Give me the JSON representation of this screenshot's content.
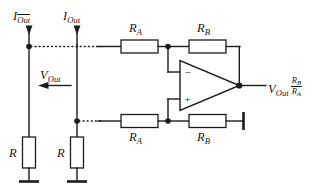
{
  "figure": {
    "type": "circuit-schematic",
    "background_color": "#ffffff",
    "line_color": "#1c1c1c"
  },
  "labels": {
    "current_out_bar": {
      "symbol": "I",
      "subscript": "Out",
      "overline": true
    },
    "current_out": {
      "symbol": "I",
      "subscript": "Out",
      "overline": false
    },
    "voltage_out": {
      "symbol": "V",
      "subscript": "Out"
    },
    "output_expression": {
      "symbol": "V",
      "subscript": "Out",
      "fraction_numerator": "R",
      "fraction_numerator_sub": "B",
      "fraction_denominator": "R",
      "fraction_denominator_sub": "A"
    },
    "resistor_r_left": {
      "symbol": "R"
    },
    "resistor_r_right": {
      "symbol": "R"
    },
    "resistor_ra_top": {
      "symbol": "R",
      "subscript": "A"
    },
    "resistor_rb_top": {
      "symbol": "R",
      "subscript": "B"
    },
    "resistor_ra_bottom": {
      "symbol": "R",
      "subscript": "A"
    },
    "resistor_rb_bottom": {
      "symbol": "R",
      "subscript": "B"
    }
  },
  "opamp": {
    "inverting_input_symbol": "−",
    "noninverting_input_symbol": "+"
  },
  "components": [
    {
      "name": "resistor-r-left",
      "label": "R",
      "orientation": "vertical"
    },
    {
      "name": "resistor-r-right",
      "label": "R",
      "orientation": "vertical"
    },
    {
      "name": "resistor-ra-top",
      "label": "RA",
      "orientation": "horizontal"
    },
    {
      "name": "resistor-rb-top",
      "label": "RB",
      "orientation": "horizontal"
    },
    {
      "name": "resistor-ra-bottom",
      "label": "RA",
      "orientation": "horizontal"
    },
    {
      "name": "resistor-rb-bottom",
      "label": "RB",
      "orientation": "horizontal"
    },
    {
      "name": "operational-amplifier",
      "label": "op-amp",
      "orientation": "right"
    },
    {
      "name": "ground-left",
      "label": "GND"
    },
    {
      "name": "ground-right",
      "label": "GND"
    },
    {
      "name": "ground-rb-bottom",
      "label": "GND"
    }
  ]
}
